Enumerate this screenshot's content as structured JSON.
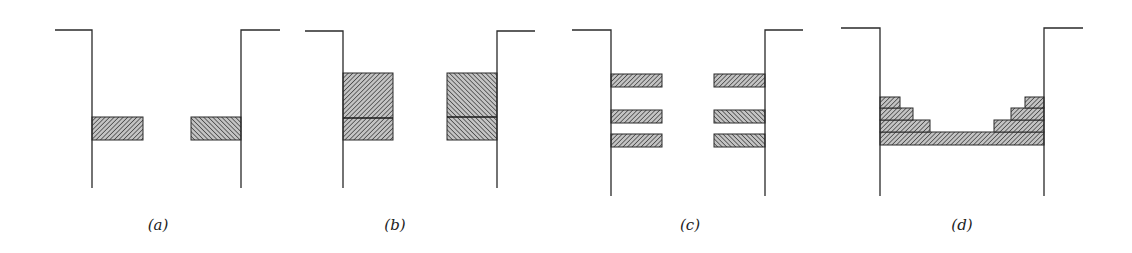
{
  "figure": {
    "colors": {
      "line": "#2a2a2a",
      "hatch": "#3a3a3a",
      "hatch_bg": "#bdbdbd",
      "background": "#ffffff"
    },
    "panels": [
      {
        "id": "a",
        "label": "(a)",
        "label_x": 158,
        "walls": {
          "left": {
            "x": 92,
            "ledge_from": 55,
            "top": 30,
            "bottom": 188
          },
          "right": {
            "x": 241,
            "ledge_to": 280,
            "top": 30,
            "bottom": 188
          }
        },
        "blocks": [
          {
            "side": "left",
            "x": 92,
            "y": 117,
            "w": 51,
            "h": 23,
            "hatch": "fwd"
          },
          {
            "side": "right",
            "x": 191,
            "y": 117,
            "w": 50,
            "h": 23,
            "hatch": "back"
          }
        ],
        "dividers": []
      },
      {
        "id": "b",
        "label": "(b)",
        "label_x": 395,
        "walls": {
          "left": {
            "x": 343,
            "ledge_from": 305,
            "top": 31,
            "bottom": 188
          },
          "right": {
            "x": 497,
            "ledge_to": 535,
            "top": 31,
            "bottom": 188
          }
        },
        "blocks": [
          {
            "side": "left",
            "x": 343,
            "y": 73,
            "w": 50,
            "h": 67,
            "hatch": "fwd"
          },
          {
            "side": "right",
            "x": 447,
            "y": 73,
            "w": 50,
            "h": 67,
            "hatch": "back"
          }
        ],
        "dividers": [
          {
            "x1": 343,
            "x2": 393,
            "y": 118
          },
          {
            "x1": 447,
            "x2": 497,
            "y": 117
          }
        ]
      },
      {
        "id": "c",
        "label": "(c)",
        "label_x": 690,
        "walls": {
          "left": {
            "x": 611,
            "ledge_from": 572,
            "top": 30,
            "bottom": 196
          },
          "right": {
            "x": 765,
            "ledge_to": 803,
            "top": 30,
            "bottom": 196
          }
        },
        "blocks": [
          {
            "side": "left",
            "x": 611,
            "y": 74,
            "w": 51,
            "h": 13,
            "hatch": "fwd"
          },
          {
            "side": "left",
            "x": 611,
            "y": 110,
            "w": 51,
            "h": 13,
            "hatch": "fwd"
          },
          {
            "side": "left",
            "x": 611,
            "y": 134,
            "w": 51,
            "h": 13,
            "hatch": "fwd"
          },
          {
            "side": "right",
            "x": 714,
            "y": 74,
            "w": 51,
            "h": 13,
            "hatch": "fwd"
          },
          {
            "side": "right",
            "x": 714,
            "y": 110,
            "w": 51,
            "h": 13,
            "hatch": "back"
          },
          {
            "side": "right",
            "x": 714,
            "y": 134,
            "w": 51,
            "h": 13,
            "hatch": "back"
          }
        ],
        "dividers": []
      },
      {
        "id": "d",
        "label": "(d)",
        "label_x": 962,
        "walls": {
          "left": {
            "x": 880,
            "ledge_from": 841,
            "top": 28,
            "bottom": 196
          },
          "right": {
            "x": 1044,
            "ledge_to": 1083,
            "top": 28,
            "bottom": 196
          }
        },
        "blocks": [
          {
            "side": "both",
            "x": 880,
            "y": 132,
            "w": 164,
            "h": 13,
            "hatch": "fwd"
          },
          {
            "side": "left",
            "x": 880,
            "y": 120,
            "w": 50,
            "h": 12,
            "hatch": "fwd"
          },
          {
            "side": "left",
            "x": 880,
            "y": 108,
            "w": 33,
            "h": 12,
            "hatch": "fwd"
          },
          {
            "side": "left",
            "x": 880,
            "y": 97,
            "w": 20,
            "h": 11,
            "hatch": "fwd"
          },
          {
            "side": "right",
            "x": 994,
            "y": 120,
            "w": 50,
            "h": 12,
            "hatch": "fwd"
          },
          {
            "side": "right",
            "x": 1011,
            "y": 108,
            "w": 33,
            "h": 12,
            "hatch": "fwd"
          },
          {
            "side": "right",
            "x": 1025,
            "y": 97,
            "w": 19,
            "h": 11,
            "hatch": "fwd"
          }
        ],
        "dividers": []
      }
    ],
    "label_y": 230
  }
}
